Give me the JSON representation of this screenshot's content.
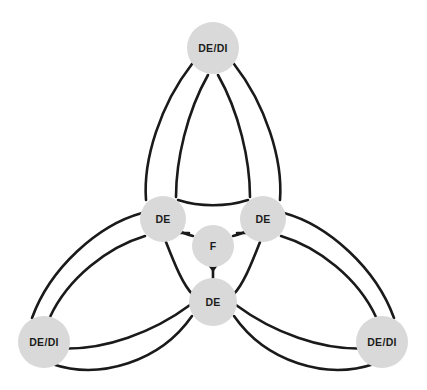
{
  "diagram": {
    "type": "triquetra-network-diagram",
    "background_color": "#ffffff",
    "edge_color": "#1a1a1a",
    "node_fill_color": "#d9d9d9",
    "label_color": "#1c1c1c",
    "nodes": [
      {
        "id": "top-outer",
        "label": "DE/DI",
        "x": 213,
        "y": 48,
        "r": 26,
        "role": "outer"
      },
      {
        "id": "left-outer",
        "label": "DE/DI",
        "x": 44,
        "y": 342,
        "r": 26,
        "role": "outer"
      },
      {
        "id": "right-outer",
        "label": "DE/DI",
        "x": 382,
        "y": 342,
        "r": 26,
        "role": "outer"
      },
      {
        "id": "left-inner",
        "label": "DE",
        "x": 163,
        "y": 219,
        "r": 23,
        "role": "inner"
      },
      {
        "id": "right-inner",
        "label": "DE",
        "x": 263,
        "y": 219,
        "r": 23,
        "role": "inner"
      },
      {
        "id": "bottom-inner",
        "label": "DE",
        "x": 213,
        "y": 302,
        "r": 24,
        "role": "inner"
      },
      {
        "id": "center",
        "label": "F",
        "x": 213,
        "y": 246,
        "r": 21,
        "role": "center"
      }
    ],
    "arrow_targets": [
      "center"
    ],
    "arrow_sources": [
      "left-inner",
      "right-inner",
      "bottom-inner"
    ]
  }
}
